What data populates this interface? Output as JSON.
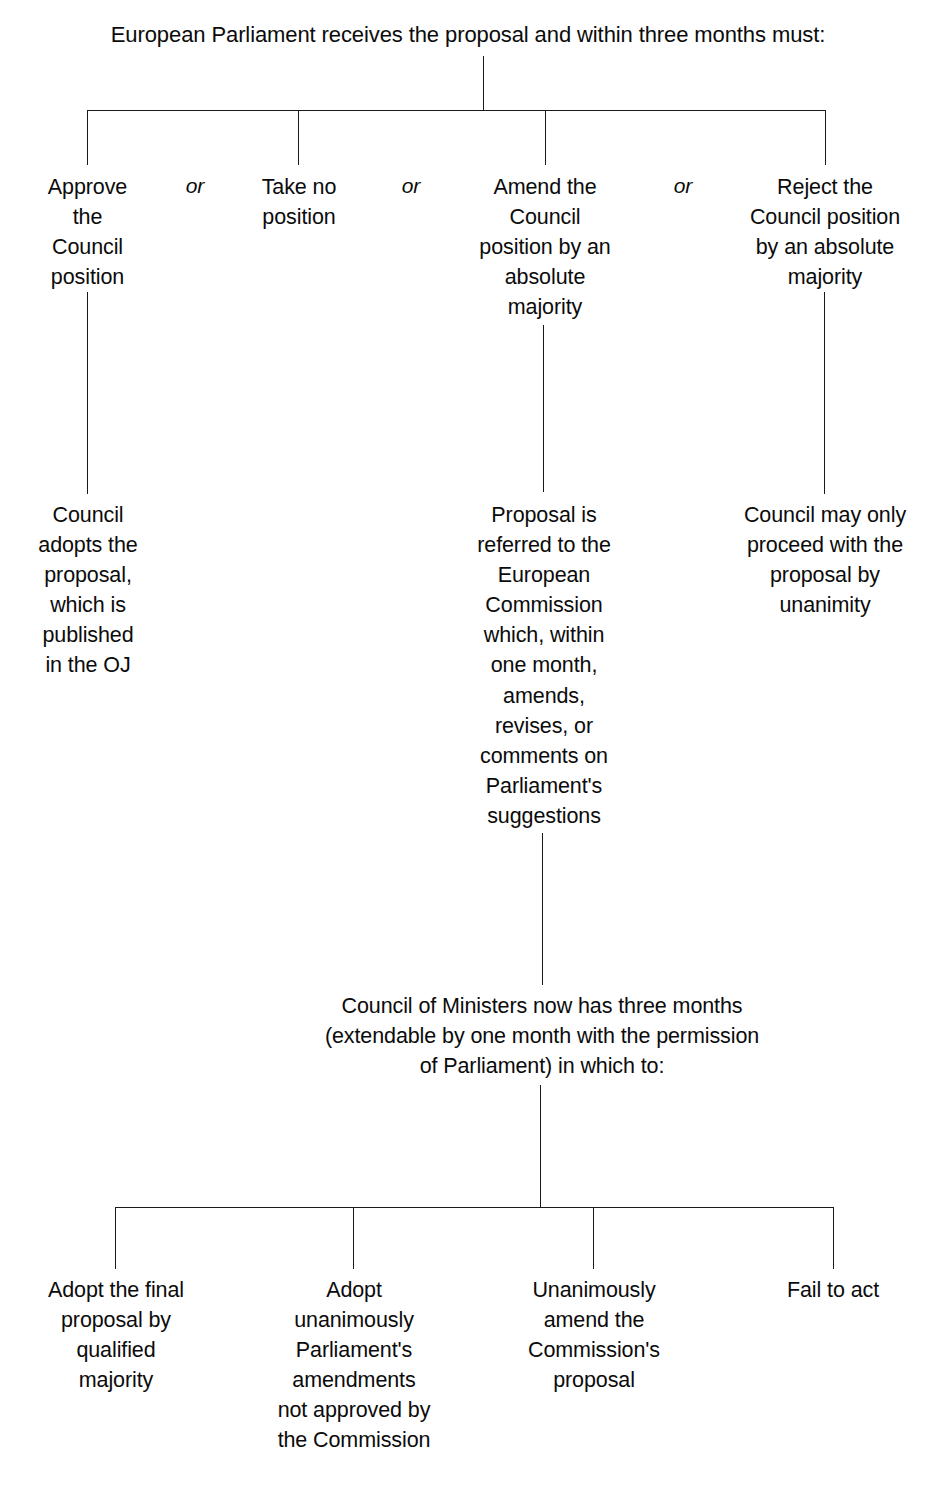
{
  "diagram": {
    "title": "European Parliament receives the proposal and within three months must:",
    "connector_color": "#1a1a1a",
    "text_color": "#0b0b0b",
    "background_color": "#ffffff",
    "or_labels": [
      "or",
      "or",
      "or"
    ],
    "stage_one": {
      "options": [
        "Approve\nthe\nCouncil\nposition",
        "Take no\nposition",
        "Amend the\nCouncil\nposition by an\nabsolute\nmajority",
        "Reject the\nCouncil position\nby an absolute\nmajority"
      ]
    },
    "stage_two": {
      "outcomes": [
        "Council\nadopts the\nproposal,\nwhich is\npublished\nin the OJ",
        "Proposal is\nreferred to the\nEuropean\nCommission\nwhich, within\none month,\namends,\nrevises, or\ncomments on\nParliament's\nsuggestions",
        "Council may only\nproceed with the\nproposal by\nunanimity"
      ]
    },
    "stage_three": {
      "heading": "Council of Ministers now has three months\n(extendable by one month with the permission\nof Parliament) in which to:"
    },
    "stage_four": {
      "options": [
        "Adopt the final\nproposal by\nqualified\nmajority",
        "Adopt\nunanimously\nParliament's\namendments\nnot approved by\nthe Commission",
        "Unanimously\namend the\nCommission's\nproposal",
        "Fail to act"
      ]
    }
  }
}
